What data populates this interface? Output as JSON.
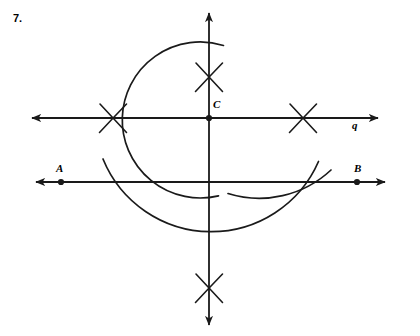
{
  "figure": {
    "problem_number": "7.",
    "width": 420,
    "height": 336,
    "stroke_color": "#1a1a1a",
    "background_color": "#ffffff"
  },
  "labels": {
    "point_c": "C",
    "point_a": "A",
    "point_b": "B",
    "line_q": "q"
  },
  "points": [
    {
      "name": "C",
      "x": 209,
      "y": 118,
      "dot": true
    },
    {
      "name": "A",
      "x": 61,
      "y": 182,
      "dot": true
    },
    {
      "name": "B",
      "x": 357,
      "y": 182,
      "dot": true
    }
  ],
  "lines": [
    {
      "name": "line-q",
      "label": "q",
      "x1": 32,
      "y1": 118,
      "x2": 378,
      "y2": 118,
      "arrow_start": true,
      "arrow_end": true
    },
    {
      "name": "line-ab",
      "label": "AB",
      "x1": 36,
      "y1": 182,
      "x2": 385,
      "y2": 182,
      "arrow_start": true,
      "arrow_end": true
    },
    {
      "name": "vertical-perpendicular",
      "label": "",
      "x1": 209,
      "y1": 13,
      "x2": 209,
      "y2": 325,
      "arrow_start": true,
      "arrow_end": true
    }
  ],
  "arcs": [
    {
      "name": "arc-c-major",
      "center_x": 209,
      "center_y": 118,
      "radius": 78,
      "start_angle_deg": -88,
      "end_angle_deg": 68,
      "note": "large arc centered at C crossing line q at right and the vertical above"
    },
    {
      "name": "arc-lower-big",
      "center_x": 209,
      "center_y": 118,
      "radius": 117,
      "start_angle_deg": 25,
      "end_angle_deg": 155,
      "note": "wide lower arc sweeping under line AB"
    },
    {
      "name": "arc-lower-right",
      "center_x": 209,
      "center_y": 118,
      "radius": 117,
      "start_angle_deg": 18,
      "end_angle_deg": 62,
      "note": "short arc on lower right"
    }
  ],
  "x_marks": [
    {
      "name": "x-mark-top",
      "x": 209,
      "y": 77,
      "size": 17
    },
    {
      "name": "x-mark-left",
      "x": 113,
      "y": 118,
      "size": 17
    },
    {
      "name": "x-mark-right",
      "x": 303,
      "y": 118,
      "size": 17
    },
    {
      "name": "x-mark-bottom",
      "x": 209,
      "y": 288,
      "size": 17
    }
  ]
}
